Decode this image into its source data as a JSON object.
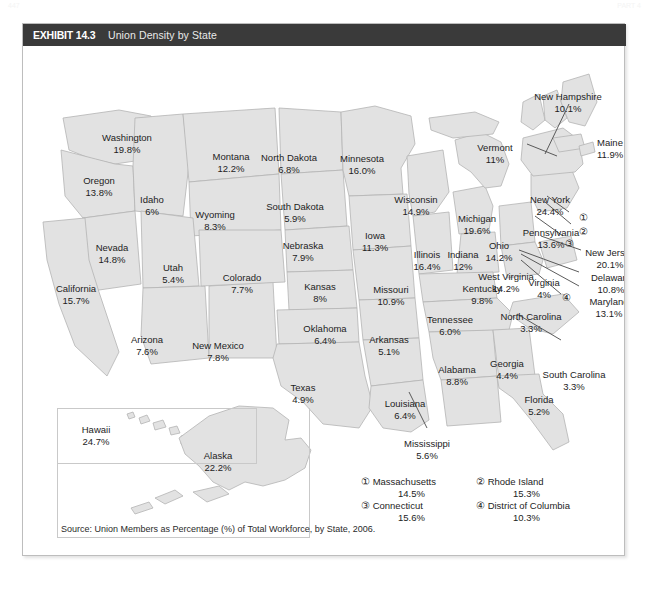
{
  "page": {
    "header_left": "447",
    "header_right": "PART 4"
  },
  "exhibit": {
    "tag": "EXHIBIT 14.3",
    "title": "Union Density by State",
    "source": "Source: Union Members as Percentage (%) of Total Workforce, by State, 2006."
  },
  "colors": {
    "header_bar": "#3a3a3a",
    "frame_border": "#bdbdbd",
    "state_fill": "#e2e2e2",
    "state_stroke": "#b4b4b4",
    "text": "#1d1d1d"
  },
  "chart_data": {
    "type": "map",
    "title": "Union Density by State",
    "subtitle": "Union Members as Percentage (%) of Total Workforce, by State, 2006",
    "unit": "percent",
    "values": [
      {
        "state": "Washington",
        "value": "19.8%"
      },
      {
        "state": "Oregon",
        "value": "13.8%"
      },
      {
        "state": "Montana",
        "value": "12.2%"
      },
      {
        "state": "Idaho",
        "value": "6%"
      },
      {
        "state": "Wyoming",
        "value": "8.3%"
      },
      {
        "state": "Nevada",
        "value": "14.8%"
      },
      {
        "state": "Utah",
        "value": "5.4%"
      },
      {
        "state": "California",
        "value": "15.7%"
      },
      {
        "state": "Arizona",
        "value": "7.6%"
      },
      {
        "state": "New Mexico",
        "value": "7.8%"
      },
      {
        "state": "Colorado",
        "value": "7.7%"
      },
      {
        "state": "North Dakota",
        "value": "6.8%"
      },
      {
        "state": "South Dakota",
        "value": "5.9%"
      },
      {
        "state": "Nebraska",
        "value": "7.9%"
      },
      {
        "state": "Kansas",
        "value": "8%"
      },
      {
        "state": "Oklahoma",
        "value": "6.4%"
      },
      {
        "state": "Texas",
        "value": "4.9%"
      },
      {
        "state": "Minnesota",
        "value": "16.0%"
      },
      {
        "state": "Iowa",
        "value": "11.3%"
      },
      {
        "state": "Missouri",
        "value": "10.9%"
      },
      {
        "state": "Arkansas",
        "value": "5.1%"
      },
      {
        "state": "Louisiana",
        "value": "6.4%"
      },
      {
        "state": "Wisconsin",
        "value": "14.9%"
      },
      {
        "state": "Illinois",
        "value": "16.4%"
      },
      {
        "state": "Michigan",
        "value": "19.6%"
      },
      {
        "state": "Indiana",
        "value": "12%"
      },
      {
        "state": "Ohio",
        "value": "14.2%"
      },
      {
        "state": "Kentucky",
        "value": "9.8%"
      },
      {
        "state": "Tennessee",
        "value": "6.0%"
      },
      {
        "state": "Mississippi",
        "value": "5.6%"
      },
      {
        "state": "Alabama",
        "value": "8.8%"
      },
      {
        "state": "Georgia",
        "value": "4.4%"
      },
      {
        "state": "Florida",
        "value": "5.2%"
      },
      {
        "state": "South Carolina",
        "value": "3.3%"
      },
      {
        "state": "North Carolina",
        "value": "3.3%"
      },
      {
        "state": "Virginia",
        "value": "4%"
      },
      {
        "state": "West Virginia",
        "value": "14.2%"
      },
      {
        "state": "Maryland",
        "value": "13.1%"
      },
      {
        "state": "Delaware",
        "value": "10.8%"
      },
      {
        "state": "Pennsylvania",
        "value": "13.6%"
      },
      {
        "state": "New Jersey",
        "value": "20.1%"
      },
      {
        "state": "New York",
        "value": "24.4%"
      },
      {
        "state": "Vermont",
        "value": "11%"
      },
      {
        "state": "New Hampshire",
        "value": "10.1%"
      },
      {
        "state": "Maine",
        "value": "11.9%"
      },
      {
        "state": "Massachusetts",
        "value": "14.5%"
      },
      {
        "state": "Rhode Island",
        "value": "15.3%"
      },
      {
        "state": "Connecticut",
        "value": "15.6%"
      },
      {
        "state": "District of Columbia",
        "value": "10.3%"
      },
      {
        "state": "Hawaii",
        "value": "24.7%"
      },
      {
        "state": "Alaska",
        "value": "22.2%"
      }
    ]
  },
  "map_labels": [
    {
      "key": "washington",
      "name": "Washington",
      "value": "19.8%",
      "x": 104,
      "y": 86
    },
    {
      "key": "oregon",
      "name": "Oregon",
      "value": "13.8%",
      "x": 76,
      "y": 129
    },
    {
      "key": "montana",
      "name": "Montana",
      "value": "12.2%",
      "x": 208,
      "y": 105
    },
    {
      "key": "idaho",
      "name": "Idaho",
      "value": "6%",
      "x": 129,
      "y": 148
    },
    {
      "key": "wyoming",
      "name": "Wyoming",
      "value": "8.3%",
      "x": 192,
      "y": 163
    },
    {
      "key": "nevada",
      "name": "Nevada",
      "value": "14.8%",
      "x": 89,
      "y": 196
    },
    {
      "key": "utah",
      "name": "Utah",
      "value": "5.4%",
      "x": 150,
      "y": 216
    },
    {
      "key": "california",
      "name": "California",
      "value": "15.7%",
      "x": 53,
      "y": 237
    },
    {
      "key": "arizona",
      "name": "Arizona",
      "value": "7.6%",
      "x": 124,
      "y": 288
    },
    {
      "key": "newmexico",
      "name": "New Mexico",
      "value": "7.8%",
      "x": 195,
      "y": 294
    },
    {
      "key": "colorado",
      "name": "Colorado",
      "value": "7.7%",
      "x": 219,
      "y": 226
    },
    {
      "key": "northdakota",
      "name": "North Dakota",
      "value": "6.8%",
      "x": 266,
      "y": 106
    },
    {
      "key": "southdakota",
      "name": "South Dakota",
      "value": "5.9%",
      "x": 272,
      "y": 155
    },
    {
      "key": "nebraska",
      "name": "Nebraska",
      "value": "7.9%",
      "x": 280,
      "y": 194
    },
    {
      "key": "kansas",
      "name": "Kansas",
      "value": "8%",
      "x": 297,
      "y": 235
    },
    {
      "key": "oklahoma",
      "name": "Oklahoma",
      "value": "6.4%",
      "x": 302,
      "y": 277
    },
    {
      "key": "texas",
      "name": "Texas",
      "value": "4.9%",
      "x": 280,
      "y": 336
    },
    {
      "key": "minnesota",
      "name": "Minnesota",
      "value": "16.0%",
      "x": 339,
      "y": 107
    },
    {
      "key": "iowa",
      "name": "Iowa",
      "value": "11.3%",
      "x": 352,
      "y": 184
    },
    {
      "key": "missouri",
      "name": "Missouri",
      "value": "10.9%",
      "x": 368,
      "y": 238
    },
    {
      "key": "arkansas",
      "name": "Arkansas",
      "value": "5.1%",
      "x": 366,
      "y": 288
    },
    {
      "key": "louisiana",
      "name": "Louisiana",
      "value": "6.4%",
      "x": 382,
      "y": 352
    },
    {
      "key": "wisconsin",
      "name": "Wisconsin",
      "value": "14.9%",
      "x": 393,
      "y": 148
    },
    {
      "key": "illinois",
      "name": "Illinois",
      "value": "16.4%",
      "x": 404,
      "y": 203
    },
    {
      "key": "michigan",
      "name": "Michigan",
      "value": "19.6%",
      "x": 454,
      "y": 167
    },
    {
      "key": "indiana",
      "name": "Indiana",
      "value": "12%",
      "x": 440,
      "y": 203
    },
    {
      "key": "ohio",
      "name": "Ohio",
      "value": "14.2%",
      "x": 476,
      "y": 194
    },
    {
      "key": "kentucky",
      "name": "Kentucky",
      "value": "9.8%",
      "x": 459,
      "y": 237
    },
    {
      "key": "tennessee",
      "name": "Tennessee",
      "value": "6.0%",
      "x": 427,
      "y": 268
    },
    {
      "key": "mississippi",
      "name": "Mississippi",
      "value": "5.6%",
      "x": 404,
      "y": 392
    },
    {
      "key": "alabama",
      "name": "Alabama",
      "value": "8.8%",
      "x": 434,
      "y": 318
    },
    {
      "key": "georgia",
      "name": "Georgia",
      "value": "4.4%",
      "x": 484,
      "y": 312
    },
    {
      "key": "florida",
      "name": "Florida",
      "value": "5.2%",
      "x": 516,
      "y": 348
    },
    {
      "key": "southcarolina",
      "name": "South Carolina",
      "value": "3.3%",
      "x": 551,
      "y": 323
    },
    {
      "key": "northcarolina",
      "name": "North Carolina",
      "value": "3.3%",
      "x": 508,
      "y": 265
    },
    {
      "key": "virginia",
      "name": "Virginia",
      "value": "4%",
      "x": 521,
      "y": 231
    },
    {
      "key": "westvirginia",
      "name": "West Virginia",
      "value": "14.2%",
      "x": 483,
      "y": 225
    },
    {
      "key": "maryland",
      "name": "Maryland",
      "value": "13.1%",
      "x": 586,
      "y": 250
    },
    {
      "key": "delaware",
      "name": "Delaware",
      "value": "10.8%",
      "x": 588,
      "y": 226
    },
    {
      "key": "pennsylvania",
      "name": "Pennsylvania",
      "value": "13.6%",
      "x": 528,
      "y": 181
    },
    {
      "key": "newjersey",
      "name": "New Jersey",
      "value": "20.1%",
      "x": 587,
      "y": 201
    },
    {
      "key": "newyork",
      "name": "New York",
      "value": "24.4%",
      "x": 527,
      "y": 148
    },
    {
      "key": "vermont",
      "name": "Vermont",
      "value": "11%",
      "x": 472,
      "y": 96
    },
    {
      "key": "newhampshire",
      "name": "New Hampshire",
      "value": "10.1%",
      "x": 545,
      "y": 45
    },
    {
      "key": "maine",
      "name": "Maine",
      "value": "11.9%",
      "x": 587,
      "y": 91
    },
    {
      "key": "hawaii",
      "name": "Hawaii",
      "value": "24.7%",
      "x": 73,
      "y": 378
    },
    {
      "key": "alaska",
      "name": "Alaska",
      "value": "22.2%",
      "x": 195,
      "y": 404
    }
  ],
  "markers": [
    {
      "key": "marker-1",
      "glyph": "①",
      "x": 560,
      "y": 166
    },
    {
      "key": "marker-2",
      "glyph": "②",
      "x": 560,
      "y": 180
    },
    {
      "key": "marker-3",
      "glyph": "③",
      "x": 546,
      "y": 192
    },
    {
      "key": "marker-4",
      "glyph": "④",
      "x": 543,
      "y": 246
    }
  ],
  "legend": {
    "items": [
      {
        "key": "legend-massachusetts",
        "glyph": "①",
        "name": "Massachusetts",
        "value": "14.5%"
      },
      {
        "key": "legend-rhode-island",
        "glyph": "②",
        "name": "Rhode Island",
        "value": "15.3%"
      },
      {
        "key": "legend-connecticut",
        "glyph": "③",
        "name": "Connecticut",
        "value": "15.6%"
      },
      {
        "key": "legend-district-of-columbia",
        "glyph": "④",
        "name": "District of Columbia",
        "value": "10.3%"
      }
    ]
  }
}
